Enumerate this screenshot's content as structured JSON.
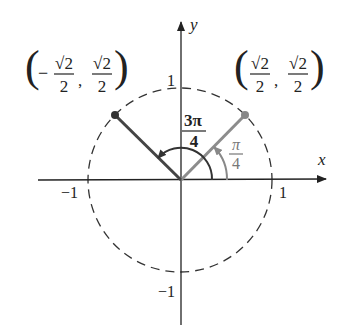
{
  "diagram": {
    "axes": {
      "x_label": "x",
      "y_label": "y"
    },
    "ticks": {
      "x_pos": "1",
      "x_neg": "−1",
      "y_pos": "1",
      "y_neg": "−1"
    },
    "point_right": {
      "label_x_num": "√2",
      "label_x_den": "2",
      "label_y_num": "√2",
      "label_y_den": "2",
      "sign": ""
    },
    "point_left": {
      "label_x_num": "√2",
      "label_x_den": "2",
      "label_y_num": "√2",
      "label_y_den": "2",
      "sign": "−"
    },
    "angle_small": {
      "num": "π",
      "den": "4",
      "value": "π/4"
    },
    "angle_large": {
      "num": "3π",
      "den": "4",
      "value": "3π/4"
    },
    "colors": {
      "right_ray": "#8c8c8c",
      "left_ray": "#444444",
      "axis": "#222222",
      "circle": "#333333"
    }
  }
}
